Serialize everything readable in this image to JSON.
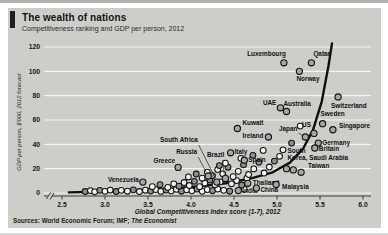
{
  "header": {
    "title": "The wealth of nations",
    "subtitle": "Competitiveness ranking and GDP per person, 2012"
  },
  "footer": {
    "sources_prefix": "Sources: World Economic Forum; IMF; ",
    "sources_italic": "The Economist"
  },
  "colors": {
    "panel_bg": "#cdcdca",
    "gridline": "#f4f4f2",
    "ink": "#161616",
    "axis": "#3a3a38",
    "trend": "#111111",
    "point_fill_light": "#f5f5f3",
    "point_fill_dark": "#8f8f8d",
    "labeled_fill": "#a6a6a4",
    "tab": "#1f1f1d"
  },
  "chart_data": {
    "type": "scatter",
    "title": "The wealth of nations",
    "subtitle": "Competitiveness ranking and GDP per person, 2012",
    "xlabel": "Global Competitiveness Index score (1-7), 2012",
    "ylabel": "GDP per person, $'000, 2012 forecast",
    "xlim": [
      2.5,
      6.0
    ],
    "ylim": [
      0,
      120
    ],
    "xticks": [
      "2.5",
      "3.0",
      "3.5",
      "4.0",
      "4.5",
      "5.0",
      "5.5",
      "6.0"
    ],
    "yticks": [
      0,
      20,
      40,
      60,
      80,
      100,
      120
    ],
    "axis_break": true,
    "grid": true,
    "legend": "none",
    "labeled_points": [
      {
        "name": "Luxembourg",
        "x": 5.08,
        "y": 107,
        "anchor": "end",
        "dx": 2,
        "dy": -7
      },
      {
        "name": "Qatar",
        "x": 5.4,
        "y": 107,
        "anchor": "start",
        "dx": 2,
        "dy": -7
      },
      {
        "name": "Norway",
        "x": 5.26,
        "y": 100,
        "anchor": "start",
        "dx": -3,
        "dy": 10
      },
      {
        "name": "Switzerland",
        "x": 5.71,
        "y": 79,
        "anchor": "start",
        "dx": -7,
        "dy": 11
      },
      {
        "name": "UAE",
        "x": 5.04,
        "y": 70,
        "anchor": "end",
        "dx": -4,
        "dy": -3
      },
      {
        "name": "Australia",
        "x": 5.11,
        "y": 67,
        "anchor": "start",
        "dx": -3,
        "dy": -6
      },
      {
        "name": "Kuwait",
        "x": 4.54,
        "y": 53,
        "anchor": "start",
        "dx": 5,
        "dy": -4
      },
      {
        "name": "Japan",
        "x": 5.33,
        "y": 46,
        "anchor": "end",
        "dx": -8,
        "dy": -6,
        "leader": [
          -7,
          -4,
          -2,
          -1
        ]
      },
      {
        "name": "US",
        "x": 5.43,
        "y": 49,
        "anchor": "end",
        "dx": -3,
        "dy": -6
      },
      {
        "name": "Sweden",
        "x": 5.53,
        "y": 57,
        "anchor": "start",
        "dx": -2,
        "dy": -8
      },
      {
        "name": "Singapore",
        "x": 5.65,
        "y": 52,
        "anchor": "start",
        "dx": 6,
        "dy": -2
      },
      {
        "name": "Ireland",
        "x": 4.9,
        "y": 46,
        "anchor": "end",
        "dx": -5,
        "dy": 1
      },
      {
        "name": "Germany",
        "x": 5.48,
        "y": 41,
        "anchor": "start",
        "dx": 4,
        "dy": 2
      },
      {
        "name": "Britain",
        "x": 5.44,
        "y": 37,
        "anchor": "start",
        "dx": 4,
        "dy": 3
      },
      {
        "name": "Italy",
        "x": 4.46,
        "y": 33,
        "anchor": "start",
        "dx": 4,
        "dy": 1
      },
      {
        "name": "Spain",
        "x": 4.62,
        "y": 27,
        "anchor": "start",
        "dx": 4,
        "dy": 2
      },
      {
        "name": "Greece",
        "x": 3.85,
        "y": 21,
        "anchor": "end",
        "dx": -3,
        "dy": -4
      },
      {
        "name": "Venezuela",
        "x": 3.44,
        "y": 9,
        "anchor": "end",
        "dx": -4,
        "dy": 0
      },
      {
        "name": "South Africa",
        "x": 4.3,
        "y": 9,
        "anchor": "end",
        "dx": -19,
        "dy": -40,
        "leader": [
          -18,
          -37,
          -2,
          -5
        ]
      },
      {
        "name": "Russia",
        "x": 4.2,
        "y": 14,
        "anchor": "end",
        "dx": -11,
        "dy": -22,
        "leader": [
          -10,
          -19,
          -2,
          -4
        ]
      },
      {
        "name": "Brazil",
        "x": 4.4,
        "y": 12,
        "anchor": "end",
        "dx": -1,
        "dy": -21,
        "leader": [
          -3,
          -18,
          -1,
          -4
        ]
      },
      {
        "name": "South Korea",
        "x": 5.11,
        "y": 20,
        "anchor": "start",
        "dx": 1,
        "dy": -16,
        "lines": [
          "South",
          "Korea,"
        ]
      },
      {
        "name": "Saudi Arabia",
        "x": 5.19,
        "y": 19,
        "anchor": "start",
        "dx": 16,
        "dy": -10
      },
      {
        "name": "Taiwan",
        "x": 5.28,
        "y": 17,
        "anchor": "start",
        "dx": 7,
        "dy": -4
      },
      {
        "name": "Thailand",
        "x": 4.66,
        "y": 8,
        "anchor": "start",
        "dx": 5,
        "dy": 2
      },
      {
        "name": "Malaysia",
        "x": 4.99,
        "y": 7,
        "anchor": "start",
        "dx": 6,
        "dy": 4
      },
      {
        "name": "India",
        "x": 4.55,
        "y": 2,
        "anchor": "start",
        "dx": 4,
        "dy": 2
      },
      {
        "name": "China",
        "x": 4.76,
        "y": 4,
        "anchor": "start",
        "dx": 4,
        "dy": 4
      }
    ],
    "unlabeled_points": [
      [
        2.77,
        1.2
      ],
      [
        2.83,
        2.0
      ],
      [
        2.88,
        1.0
      ],
      [
        2.94,
        2.2
      ],
      [
        3.0,
        1.4
      ],
      [
        3.06,
        2.4
      ],
      [
        3.13,
        1.2
      ],
      [
        3.19,
        2.2
      ],
      [
        3.26,
        1.5
      ],
      [
        3.33,
        2.6
      ],
      [
        3.4,
        1.2
      ],
      [
        3.47,
        2.3
      ],
      [
        3.53,
        1.6
      ],
      [
        3.59,
        2.8
      ],
      [
        3.65,
        1.3
      ],
      [
        3.71,
        2.4
      ],
      [
        3.77,
        1.7
      ],
      [
        3.83,
        3.0
      ],
      [
        3.89,
        1.5
      ],
      [
        3.95,
        2.6
      ],
      [
        4.01,
        1.8
      ],
      [
        4.07,
        3.2
      ],
      [
        4.13,
        1.4
      ],
      [
        4.19,
        2.8
      ],
      [
        4.25,
        1.9
      ],
      [
        4.31,
        3.3
      ],
      [
        4.38,
        2.2
      ],
      [
        4.45,
        1.5
      ],
      [
        4.62,
        3.0
      ],
      [
        3.55,
        5.2
      ],
      [
        3.64,
        6.8
      ],
      [
        3.73,
        4.6
      ],
      [
        3.8,
        7.6
      ],
      [
        3.86,
        5.6
      ],
      [
        3.92,
        8.6
      ],
      [
        3.98,
        6.2
      ],
      [
        4.04,
        9.6
      ],
      [
        4.1,
        5.2
      ],
      [
        4.16,
        8.2
      ],
      [
        4.22,
        10.6
      ],
      [
        4.28,
        6.8
      ],
      [
        4.34,
        9.2
      ],
      [
        4.4,
        11.6
      ],
      [
        4.47,
        7.6
      ],
      [
        4.53,
        10.2
      ],
      [
        4.59,
        6.6
      ],
      [
        4.65,
        12.2
      ],
      [
        3.97,
        13.2
      ],
      [
        4.06,
        15.6
      ],
      [
        4.13,
        12.2
      ],
      [
        4.19,
        17.2
      ],
      [
        4.25,
        14.2
      ],
      [
        4.31,
        19.2
      ],
      [
        4.37,
        15.8
      ],
      [
        4.43,
        21.2
      ],
      [
        4.49,
        13.4
      ],
      [
        4.55,
        17.8
      ],
      [
        4.61,
        23.2
      ],
      [
        4.67,
        15.2
      ],
      [
        4.73,
        19.8
      ],
      [
        4.79,
        25.2
      ],
      [
        4.85,
        16.4
      ],
      [
        4.91,
        21.4
      ],
      [
        4.97,
        26.2
      ],
      [
        5.03,
        30.2
      ],
      [
        4.58,
        28.5
      ],
      [
        4.72,
        31.0
      ],
      [
        4.84,
        35.0
      ],
      [
        5.07,
        35.5
      ],
      [
        5.17,
        41.0
      ],
      [
        5.27,
        55.0
      ],
      [
        4.4,
        24.5
      ],
      [
        4.33,
        22.5
      ]
    ],
    "trend": [
      [
        2.58,
        0.5
      ],
      [
        3.0,
        1.2
      ],
      [
        3.4,
        2.2
      ],
      [
        3.8,
        3.8
      ],
      [
        4.1,
        5.5
      ],
      [
        4.4,
        8.0
      ],
      [
        4.7,
        12.0
      ],
      [
        4.95,
        17.0
      ],
      [
        5.15,
        25.0
      ],
      [
        5.3,
        36.0
      ],
      [
        5.42,
        52.0
      ],
      [
        5.52,
        75.0
      ],
      [
        5.6,
        105.0
      ],
      [
        5.64,
        123.0
      ]
    ]
  }
}
